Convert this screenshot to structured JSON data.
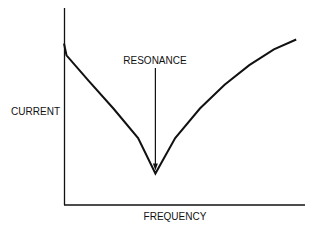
{
  "chart_data": {
    "type": "line",
    "title": "",
    "xlabel": "FREQUENCY",
    "ylabel": "CURRENT",
    "annotation": "RESONANCE",
    "grid": false,
    "legend": "none",
    "xlim": [
      0,
      1
    ],
    "ylim": [
      0,
      1
    ],
    "series": [
      {
        "name": "current-vs-frequency",
        "x": [
          0,
          0.01,
          0.1,
          0.2,
          0.3,
          0.37,
          0.45,
          0.55,
          0.65,
          0.75,
          0.85,
          0.94
        ],
        "y": [
          0.82,
          0.76,
          0.63,
          0.49,
          0.34,
          0.16,
          0.34,
          0.49,
          0.61,
          0.71,
          0.79,
          0.84
        ]
      }
    ],
    "resonance_x": 0.37
  },
  "colors": {
    "ink": "#111111",
    "background": "#ffffff"
  }
}
